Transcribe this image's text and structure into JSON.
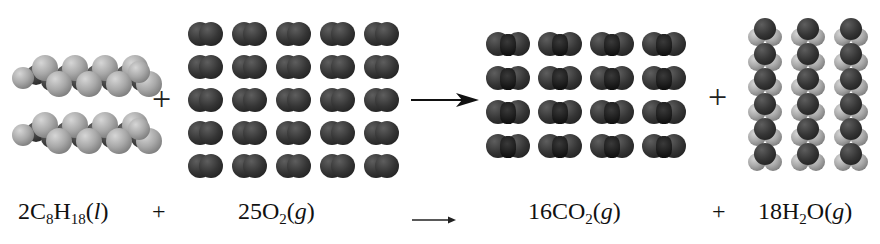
{
  "reaction": {
    "reactants": [
      {
        "coefficient": "2",
        "formula": "C8H18",
        "parts": [
          "2C",
          "8",
          "H",
          "18",
          "(",
          "l",
          ")"
        ],
        "state": "l",
        "molecule_count": 2,
        "model": "octane-space-filling"
      },
      {
        "coefficient": "25",
        "formula": "O2",
        "parts": [
          "25O",
          "2",
          "(",
          "g",
          ")"
        ],
        "state": "g",
        "molecule_count": 25,
        "grid": {
          "rows": 5,
          "cols": 5
        },
        "model": "dioxygen-space-filling"
      }
    ],
    "products": [
      {
        "coefficient": "16",
        "formula": "CO2",
        "parts": [
          "16CO",
          "2",
          "(",
          "g",
          ")"
        ],
        "state": "g",
        "molecule_count": 16,
        "grid": {
          "rows": 4,
          "cols": 4
        },
        "model": "carbon-dioxide-space-filling"
      },
      {
        "coefficient": "18",
        "formula": "H2O",
        "parts": [
          "18H",
          "2",
          "O(",
          "g",
          ")"
        ],
        "state": "g",
        "molecule_count": 18,
        "grid": {
          "rows": 6,
          "cols": 3
        },
        "model": "water-space-filling"
      }
    ],
    "plus_sign": "+",
    "arrow": "→"
  },
  "colors": {
    "background": "#ffffff",
    "hydrogen": "#a8a8a8",
    "carbon_oxygen": "#333333",
    "text": "#111111"
  }
}
